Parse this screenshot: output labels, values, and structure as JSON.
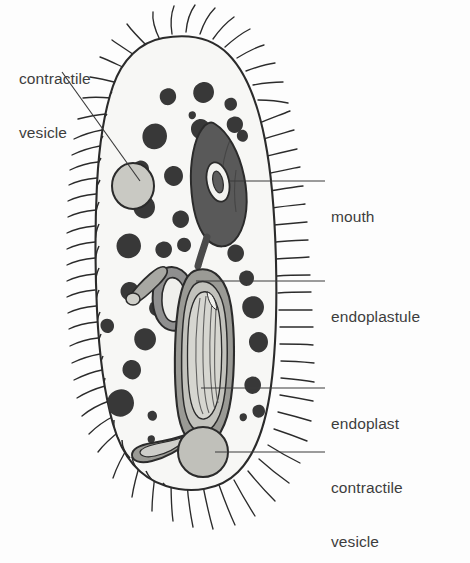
{
  "figure": {
    "organism": "paramecium",
    "background_color": "#fdfdfd",
    "ink_color": "#2b2b2b",
    "label_color": "#3d3d3d"
  },
  "labels": [
    {
      "id": "contractile-vesicle-top",
      "line1": "contractile",
      "line2": "vesicle",
      "position": "top-left",
      "leader": "diagonal"
    },
    {
      "id": "mouth",
      "line1": "mouth",
      "line2": "",
      "position": "right",
      "leader": "horizontal"
    },
    {
      "id": "endoplastule",
      "line1": "endoplastule",
      "line2": "",
      "position": "right",
      "leader": "horizontal"
    },
    {
      "id": "endoplast",
      "line1": "endoplast",
      "line2": "",
      "position": "right",
      "leader": "horizontal"
    },
    {
      "id": "contractile-vesicle-bottom",
      "line1": "contractile",
      "line2": "vesicle",
      "position": "bottom-right",
      "leader": "horizontal"
    }
  ],
  "structures": {
    "cell_body": {
      "name": "cell-body",
      "fill": "#f7f7f5",
      "stroke": "#2b2b2b",
      "outline_style": "scalloped"
    },
    "cilia": {
      "name": "cilia",
      "stroke": "#2b2b2b",
      "count_approx": 120
    },
    "mouth": {
      "name": "oral-groove-mouth",
      "fill": "#595959",
      "inner_fill": "#f2f2ef"
    },
    "endoplastule": {
      "name": "endoplastule",
      "fill": "#8f8f8f",
      "inner_fill": "#efefec"
    },
    "endoplast": {
      "name": "endoplast",
      "fill": "#8f8f8f",
      "inner_fill": "#d8d8d2"
    },
    "contractile_vesicle_top": {
      "name": "contractile-vesicle-top",
      "fill": "#c9c9c3"
    },
    "contractile_vesicle_bottom": {
      "name": "contractile-vesicle-bottom",
      "fill": "#c0c0ba"
    },
    "granules": {
      "name": "cytoplasmic-granules",
      "fill": "#383838",
      "count_approx": 28
    }
  }
}
